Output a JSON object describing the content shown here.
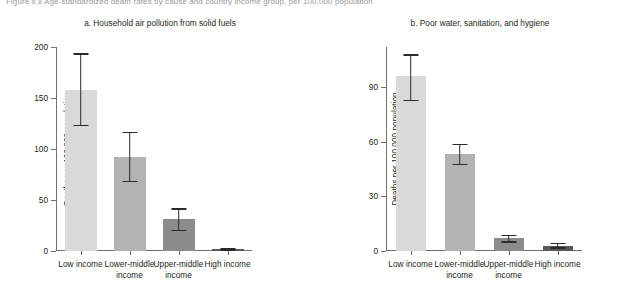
{
  "figure_caption": "Figure x.x  Age-standardized death rates by cause and country income group, per 100,000 population",
  "axis": {
    "ylabel": "Deaths per 100,000 population"
  },
  "colors": {
    "bar_low_income": "#d9d9d9",
    "bar_lower_middle": "#b3b3b3",
    "bar_upper_middle": "#8c8c8c",
    "bar_high_income": "#595959",
    "error_bar": "#2b2b2b",
    "axis": "#6f6f6f",
    "text": "#231f20"
  },
  "chart_data": [
    {
      "type": "bar",
      "panel": "a",
      "title": "a. Household air pollution from solid fuels",
      "xlabel": "",
      "ylabel": "Deaths per 100,000 population",
      "ylim": [
        0,
        200
      ],
      "yticks": [
        0,
        50,
        100,
        150,
        200
      ],
      "ytick_labels": [
        "0",
        "50",
        "100",
        "150",
        "200"
      ],
      "grid": false,
      "legend": "none",
      "categories": [
        "Low income",
        "Lower-middle income",
        "Upper-middle income",
        "High income"
      ],
      "category_lines": [
        [
          "Low income"
        ],
        [
          "Lower-middle",
          "income"
        ],
        [
          "Upper-middle",
          "income"
        ],
        [
          "High income"
        ]
      ],
      "values": [
        158,
        92,
        31,
        2
      ],
      "error_low": [
        124,
        69,
        21,
        1.5
      ],
      "error_high": [
        194,
        117,
        42,
        2.5
      ]
    },
    {
      "type": "bar",
      "panel": "b",
      "title": "b. Poor water, sanitation, and hygiene",
      "xlabel": "",
      "ylabel": "Deaths per 100,000 population",
      "ylim": [
        0,
        112
      ],
      "yticks": [
        0,
        30,
        60,
        90
      ],
      "ytick_labels": [
        "0",
        "30",
        "60",
        "90"
      ],
      "grid": false,
      "legend": "none",
      "categories": [
        "Low income",
        "Lower-middle income",
        "Upper-middle income",
        "High income"
      ],
      "category_lines": [
        [
          "Low income"
        ],
        [
          "Lower-middle",
          "income"
        ],
        [
          "Upper-middle",
          "income"
        ],
        [
          "High income"
        ]
      ],
      "values": [
        96,
        53,
        7,
        3
      ],
      "error_low": [
        83,
        48,
        5.5,
        2
      ],
      "error_high": [
        108,
        59,
        9,
        4.5
      ]
    }
  ]
}
